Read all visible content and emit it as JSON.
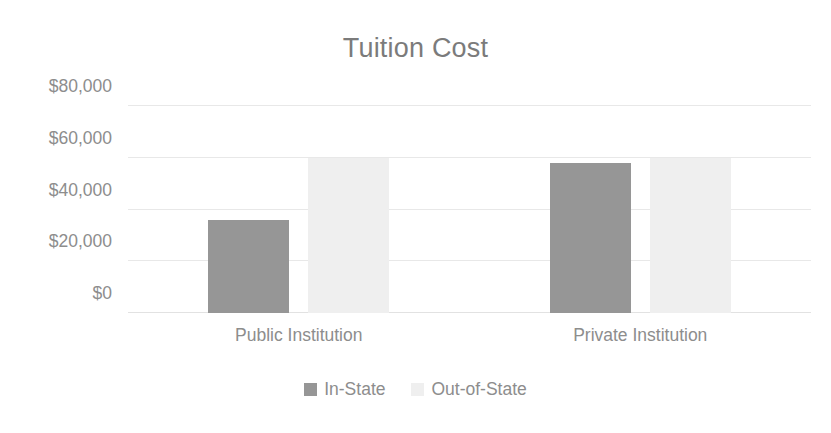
{
  "chart_data": {
    "type": "bar",
    "title": "Tuition Cost",
    "xlabel": "",
    "ylabel": "",
    "categories": [
      "Public Institution",
      "Private Institution"
    ],
    "series": [
      {
        "name": "In-State",
        "values": [
          36000,
          58000
        ],
        "color": "#969696"
      },
      {
        "name": "Out-of-State",
        "values": [
          60000,
          60000
        ],
        "color": "#efefef"
      }
    ],
    "yticks": [
      0,
      20000,
      40000,
      60000,
      80000
    ],
    "ytick_labels": [
      "$0",
      "$20,000",
      "$40,000",
      "$60,000",
      "$80,000"
    ],
    "ylim": [
      0,
      80000
    ],
    "grid": true,
    "legend_position": "bottom",
    "colors": {
      "title": "#7b7b7b",
      "axis_text": "#8d8d8d",
      "gridline": "#e8e8e8",
      "background": "#ffffff",
      "in_state": "#969696",
      "out_of_state": "#efefef"
    }
  }
}
